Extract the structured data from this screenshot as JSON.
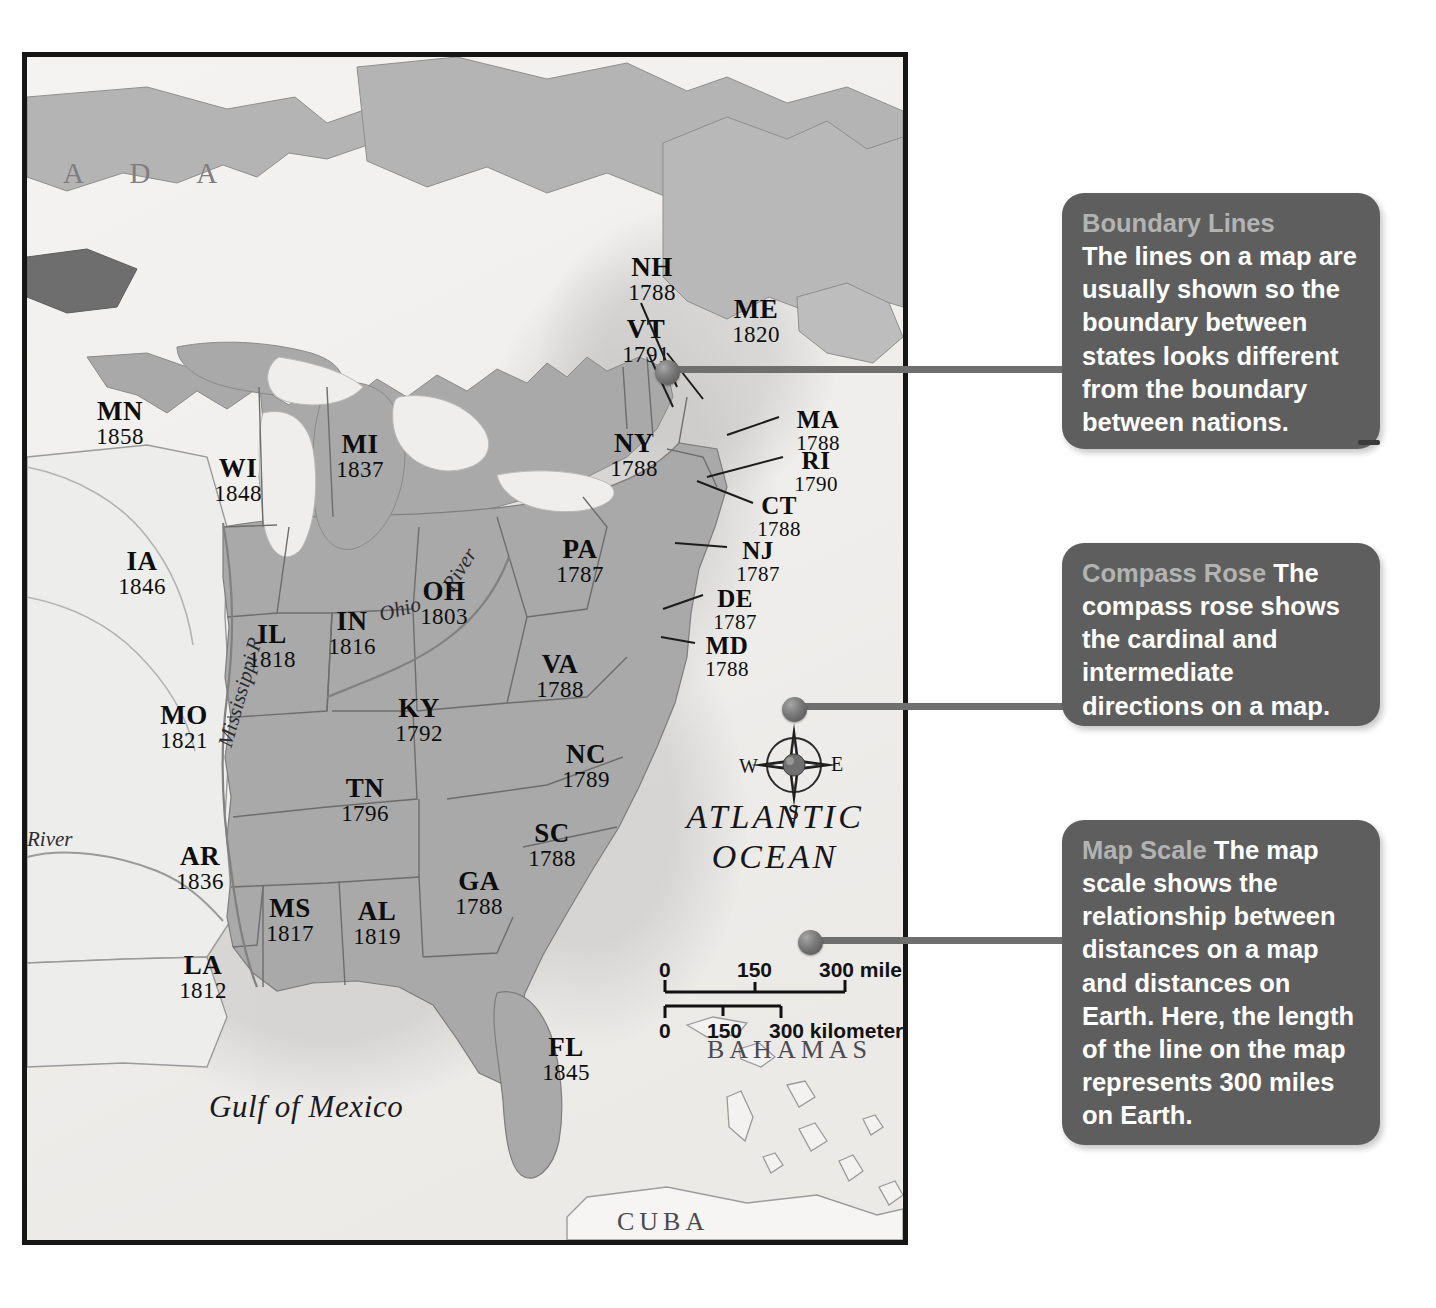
{
  "map": {
    "frame_label": "eastern-united-states-statehood-map",
    "background_color": "#f2f1ef",
    "land_fill": "#a9a9a9",
    "unorganized_fill": "#ededeb",
    "border_color": "#161616",
    "country_labels": [
      {
        "name": "canada",
        "text": "A   D   A"
      }
    ],
    "water_labels": [
      {
        "name": "atlantic-ocean",
        "line1": "ATLANTIC",
        "line2": "OCEAN"
      },
      {
        "name": "gulf-of-mexico",
        "text": "Gulf of Mexico"
      }
    ],
    "island_labels": [
      {
        "name": "bahamas",
        "text": "BAHAMAS"
      },
      {
        "name": "cuba",
        "text": "CUBA"
      }
    ],
    "river_labels": [
      {
        "name": "ohio-river-ohio",
        "text": "Ohio"
      },
      {
        "name": "ohio-river-river",
        "text": "River"
      },
      {
        "name": "mississippi-river",
        "text": "Mississippi R."
      },
      {
        "name": "red-river",
        "text": "River"
      }
    ],
    "states": [
      {
        "abbr": "MN",
        "year": "1858",
        "x": 93,
        "y": 340
      },
      {
        "abbr": "WI",
        "year": "1848",
        "x": 211,
        "y": 397
      },
      {
        "abbr": "MI",
        "year": "1837",
        "x": 333,
        "y": 373
      },
      {
        "abbr": "IA",
        "year": "1846",
        "x": 115,
        "y": 490
      },
      {
        "abbr": "IL",
        "year": "1818",
        "x": 245,
        "y": 563
      },
      {
        "abbr": "IN",
        "year": "1816",
        "x": 325,
        "y": 550
      },
      {
        "abbr": "OH",
        "year": "1803",
        "x": 417,
        "y": 520
      },
      {
        "abbr": "PA",
        "year": "1787",
        "x": 553,
        "y": 478
      },
      {
        "abbr": "MO",
        "year": "1821",
        "x": 157,
        "y": 644
      },
      {
        "abbr": "KY",
        "year": "1792",
        "x": 392,
        "y": 637
      },
      {
        "abbr": "VA",
        "year": "1788",
        "x": 533,
        "y": 593
      },
      {
        "abbr": "TN",
        "year": "1796",
        "x": 338,
        "y": 717
      },
      {
        "abbr": "NC",
        "year": "1789",
        "x": 559,
        "y": 683
      },
      {
        "abbr": "AR",
        "year": "1836",
        "x": 173,
        "y": 785
      },
      {
        "abbr": "SC",
        "year": "1788",
        "x": 525,
        "y": 762
      },
      {
        "abbr": "MS",
        "year": "1817",
        "x": 263,
        "y": 837
      },
      {
        "abbr": "AL",
        "year": "1819",
        "x": 350,
        "y": 840
      },
      {
        "abbr": "GA",
        "year": "1788",
        "x": 452,
        "y": 810
      },
      {
        "abbr": "LA",
        "year": "1812",
        "x": 176,
        "y": 894
      },
      {
        "abbr": "FL",
        "year": "1845",
        "x": 539,
        "y": 976
      },
      {
        "abbr": "NH",
        "year": "1788",
        "x": 625,
        "y": 196
      },
      {
        "abbr": "VT",
        "year": "1791",
        "x": 619,
        "y": 258
      },
      {
        "abbr": "ME",
        "year": "1820",
        "x": 729,
        "y": 238
      },
      {
        "abbr": "NY",
        "year": "1788",
        "x": 607,
        "y": 372
      },
      {
        "abbr": "MA",
        "year": "1788",
        "x": 791,
        "y": 350
      },
      {
        "abbr": "RI",
        "year": "1790",
        "x": 789,
        "y": 391
      },
      {
        "abbr": "CT",
        "year": "1788",
        "x": 752,
        "y": 436
      },
      {
        "abbr": "NJ",
        "year": "1787",
        "x": 731,
        "y": 481
      },
      {
        "abbr": "DE",
        "year": "1787",
        "x": 708,
        "y": 529
      },
      {
        "abbr": "MD",
        "year": "1788",
        "x": 700,
        "y": 576
      }
    ],
    "compass": {
      "name": "compass-rose",
      "north": "N",
      "south": "S",
      "east": "E",
      "west": "W"
    },
    "scale": {
      "name": "map-scale-bar",
      "miles": {
        "ticks": [
          "0",
          "150",
          "300 miles"
        ]
      },
      "kilometers": {
        "ticks": [
          "0",
          "150",
          "300 kilometers"
        ]
      }
    }
  },
  "callouts": [
    {
      "name": "callout-boundary-lines",
      "heading": "Boundary Lines",
      "body": "The lines on a map are usually shown so the boundary between states looks different from the boundary between nations.",
      "bg_color": "#5e5e5e",
      "heading_color": "#b3b3b3"
    },
    {
      "name": "callout-compass-rose",
      "heading": "Compass Rose ",
      "body": "The compass rose shows the cardinal and intermediate directions on a map.",
      "bg_color": "#5e5e5e",
      "heading_color": "#b3b3b3"
    },
    {
      "name": "callout-map-scale",
      "heading": "Map Scale ",
      "body": "The map scale shows the relationship between distances on a map and distances on Earth. Here, the length of the line on the map represents 300 miles on Earth.",
      "bg_color": "#5e5e5e",
      "heading_color": "#b3b3b3"
    }
  ]
}
